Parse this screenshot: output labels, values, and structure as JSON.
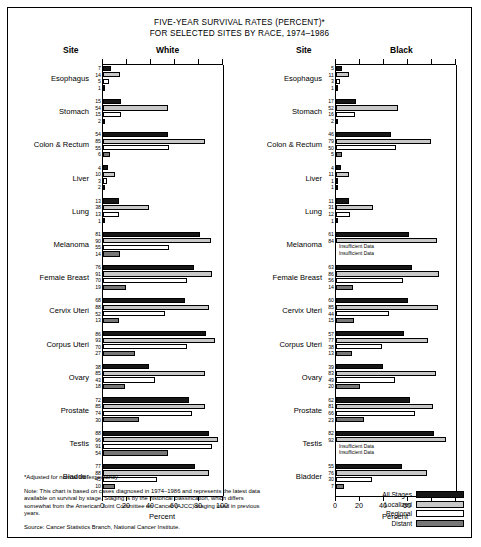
{
  "title_line1": "FIVE-YEAR SURVIVAL RATES (PERCENT)*",
  "title_line2": "FOR SELECTED SITES BY RACE, 1974–1986",
  "headers": {
    "site_white": "Site",
    "white": "White",
    "site_black": "Site",
    "black": "Black"
  },
  "axis": {
    "label": "Percent",
    "ticks": [
      "0",
      "20",
      "40",
      "60",
      "80",
      "100"
    ],
    "min": 0,
    "max": 100
  },
  "legend": [
    {
      "label": "All Stages",
      "color": "#161616"
    },
    {
      "label": "Localized",
      "color": "#c8c8c8"
    },
    {
      "label": "Regional",
      "color": "#ffffff"
    },
    {
      "label": "Distant",
      "color": "#777777"
    }
  ],
  "insufficient_text": "Insufficient Data",
  "notes": {
    "footnote": "*Adjusted for normal life expectancy",
    "note": "Note: This chart is based on cases diagnosed in 1974–1986 and represents the latest data available on survival by stage. Staging is by the historical classification, which differs somewhat from the American Joint Committee on Cancer (AJCC) staging used in previous years.",
    "source": "Source: Cancer Statistics Branch, National Cancer Institute."
  },
  "chart_data": {
    "type": "bar",
    "title": "FIVE-YEAR SURVIVAL RATES (PERCENT)* FOR SELECTED SITES BY RACE, 1974–1986",
    "xlabel": "Percent",
    "ylabel": "Site",
    "xlim": [
      0,
      100
    ],
    "grid": false,
    "legend_position": "bottom-right",
    "series_names": [
      "All Stages",
      "Localized",
      "Regional",
      "Distant"
    ],
    "categories": [
      "Esophagus",
      "Stomach",
      "Colon & Rectum",
      "Liver",
      "Lung",
      "Melanoma",
      "Female Breast",
      "Cervix Uteri",
      "Corpus Uteri",
      "Ovary",
      "Prostate",
      "Testis",
      "Bladder"
    ],
    "panels": [
      {
        "name": "White",
        "rows": [
          {
            "site": "Esophagus",
            "values": [
              7,
              14,
              5,
              1
            ]
          },
          {
            "site": "Stomach",
            "values": [
              15,
              54,
              15,
              2
            ]
          },
          {
            "site": "Colon & Rectum",
            "values": [
              54,
              85,
              55,
              6
            ]
          },
          {
            "site": "Liver",
            "values": [
              4,
              10,
              3,
              2
            ]
          },
          {
            "site": "Lung",
            "values": [
              13,
              38,
              13,
              1
            ]
          },
          {
            "site": "Melanoma",
            "values": [
              81,
              90,
              55,
              14
            ]
          },
          {
            "site": "Female Breast",
            "values": [
              76,
              91,
              70,
              19
            ]
          },
          {
            "site": "Cervix Uteri",
            "values": [
              68,
              88,
              52,
              13
            ]
          },
          {
            "site": "Corpus Uteri",
            "values": [
              86,
              93,
              70,
              27
            ]
          },
          {
            "site": "Ovary",
            "values": [
              38,
              85,
              43,
              18
            ]
          },
          {
            "site": "Prostate",
            "values": [
              72,
              85,
              74,
              30
            ]
          },
          {
            "site": "Testis",
            "values": [
              88,
              96,
              91,
              54
            ]
          },
          {
            "site": "Bladder",
            "values": [
              77,
              88,
              45,
              10
            ]
          }
        ]
      },
      {
        "name": "Black",
        "rows": [
          {
            "site": "Esophagus",
            "values": [
              5,
              11,
              3,
              1
            ]
          },
          {
            "site": "Stomach",
            "values": [
              17,
              52,
              16,
              2
            ]
          },
          {
            "site": "Colon & Rectum",
            "values": [
              46,
              79,
              50,
              5
            ]
          },
          {
            "site": "Liver",
            "values": [
              4,
              11,
              1,
              1
            ]
          },
          {
            "site": "Lung",
            "values": [
              11,
              31,
              12,
              1
            ]
          },
          {
            "site": "Melanoma",
            "values": [
              61,
              84,
              null,
              null
            ]
          },
          {
            "site": "Female Breast",
            "values": [
              63,
              86,
              56,
              14
            ]
          },
          {
            "site": "Cervix Uteri",
            "values": [
              60,
              85,
              44,
              15
            ]
          },
          {
            "site": "Corpus Uteri",
            "values": [
              57,
              77,
              38,
              13
            ]
          },
          {
            "site": "Ovary",
            "values": [
              39,
              83,
              49,
              20
            ]
          },
          {
            "site": "Prostate",
            "values": [
              62,
              81,
              66,
              23
            ]
          },
          {
            "site": "Testis",
            "values": [
              82,
              92,
              null,
              null
            ]
          },
          {
            "site": "Bladder",
            "values": [
              55,
              76,
              30,
              7
            ]
          }
        ]
      }
    ]
  }
}
